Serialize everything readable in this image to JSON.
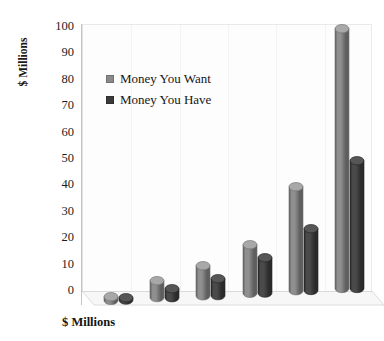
{
  "chart_data": {
    "type": "bar",
    "title": "",
    "subtitle": "",
    "xlabel": "$ Millions",
    "ylabel": "$ Millions",
    "categories": [
      "1",
      "2",
      "3",
      "4",
      "5",
      "6"
    ],
    "series": [
      {
        "name": "Money You Want",
        "color": "#777777",
        "values": [
          3,
          8,
          13,
          20,
          41,
          100
        ]
      },
      {
        "name": "Money You Have",
        "color": "#3f3f3f",
        "values": [
          2.5,
          5,
          8,
          15,
          25,
          50
        ]
      }
    ],
    "ylim": [
      0,
      100
    ],
    "ytick_labels": [
      "0",
      "10",
      "20",
      "30",
      "40",
      "50",
      "60",
      "70",
      "80",
      "90",
      "100"
    ],
    "ytick_values": [
      0,
      10,
      20,
      30,
      40,
      50,
      60,
      70,
      80,
      90,
      100
    ],
    "xtick_labels": [
      "",
      "",
      "",
      "",
      "",
      ""
    ],
    "grid": false,
    "legend_position": "upper-left-inside",
    "style": "3d-cylinder",
    "plot_background": "#fdfdfd",
    "floor_color": "#f4f4f4",
    "axis_color": "#c4c4c4"
  },
  "legend": {
    "items": [
      {
        "label": "Money You Want",
        "color": "#8a8a8a"
      },
      {
        "label": "Money You Have",
        "color": "#3a3a3a"
      }
    ]
  },
  "axes": {
    "y_title": "$ Millions",
    "x_title": "$ Millions"
  }
}
